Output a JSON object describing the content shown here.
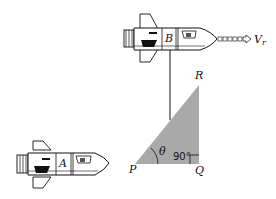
{
  "diagram": {
    "ships": [
      {
        "id": "A",
        "label": "A"
      },
      {
        "id": "B",
        "label": "B"
      }
    ],
    "velocity": {
      "label_main": "V",
      "label_sub": "r"
    },
    "triangle": {
      "vertices": {
        "P": "P",
        "Q": "Q",
        "R": "R"
      },
      "angle_label": "θ",
      "right_angle_label": "90°",
      "fill_color": "#a9a9a9"
    }
  }
}
